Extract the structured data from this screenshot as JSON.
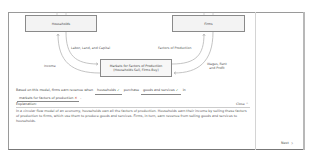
{
  "diagram": {
    "households": "Households",
    "firms": "Firms",
    "markets_line1": "Markets for Factors of Production",
    "markets_line2": "(Households Sell, Firms Buy)",
    "labels": {
      "labor": "Labor, Land, and Capital",
      "factors": "Factors of Production",
      "income": "Income",
      "wages_line1": "Wages, Rent",
      "wages_line2": "and Profit"
    }
  },
  "question": {
    "prefix": "Based on this model, firms earn revenue when",
    "blank1": {
      "value": "households",
      "status": "correct",
      "mark": "✓"
    },
    "middle": "purchase",
    "blank2": {
      "value": "goods and services",
      "status": "correct",
      "mark": "✓"
    },
    "middle2": "in",
    "blank3": {
      "value": "markets for factors of production",
      "status": "incorrect",
      "mark": "✕"
    },
    "suffix": "."
  },
  "explanation": {
    "heading": "Explanation:",
    "close_label": "Close",
    "close_icon": "^",
    "text": "In a circular flow model of an economy, households own all the factors of production. Households earn their income by selling these factors of production to firms, which use them to produce goods and services. Firms, in turn, earn revenue from selling goods and services to households."
  },
  "nav": {
    "next_label": "Next",
    "next_icon": "›"
  },
  "colors": {
    "correct": "#3a8a3a",
    "incorrect": "#c0392b",
    "border": "#8a8a8a"
  }
}
